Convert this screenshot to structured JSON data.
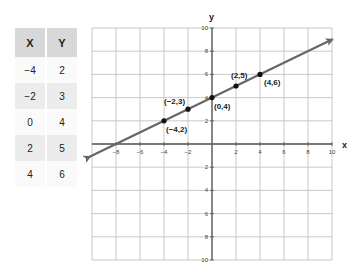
{
  "table": {
    "headers": [
      "X",
      "Y"
    ],
    "rows": [
      {
        "x": "−4",
        "y": "2"
      },
      {
        "x": "−2",
        "y": "3"
      },
      {
        "x": "0",
        "y": "4"
      },
      {
        "x": "2",
        "y": "5"
      },
      {
        "x": "4",
        "y": "6"
      }
    ]
  },
  "chart_data": {
    "type": "line",
    "title": "",
    "xlabel": "x",
    "ylabel": "y",
    "xlim": [
      -10,
      10
    ],
    "ylim": [
      -10,
      10
    ],
    "grid": true,
    "x_ticks": [
      "−8",
      "−6",
      "−4",
      "−2",
      "2",
      "4",
      "6",
      "8",
      "10"
    ],
    "y_ticks": [
      "10",
      "8",
      "6",
      "4",
      "2",
      "2",
      "4",
      "6",
      "8",
      "10"
    ],
    "line": {
      "slope": 0.5,
      "intercept": 4,
      "equation": "y = 0.5x + 4",
      "arrows_both_ends": true
    },
    "series": [
      {
        "name": "points",
        "x": [
          -4,
          -2,
          0,
          2,
          4
        ],
        "y": [
          2,
          3,
          4,
          5,
          6
        ],
        "labels": [
          "(−4,2)",
          "(−2,3)",
          "(0,4)",
          "(2,5)",
          "(4,6)"
        ]
      }
    ],
    "colors": {
      "line": "#666666",
      "points": "#111111",
      "grid": "#bbbbbb",
      "axis": "#555555"
    }
  }
}
